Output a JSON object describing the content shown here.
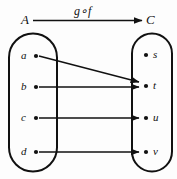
{
  "figure": {
    "type": "function-composition-mapping-diagram",
    "domain_set": {
      "name": "A",
      "elements": [
        "a",
        "b",
        "c",
        "d"
      ]
    },
    "codomain_set": {
      "name": "C",
      "elements": [
        "s",
        "t",
        "u",
        "v"
      ]
    },
    "mapping_label": "g∘f",
    "arrows": [
      {
        "from": "a",
        "to": "t"
      },
      {
        "from": "b",
        "to": "t"
      },
      {
        "from": "c",
        "to": "u"
      },
      {
        "from": "d",
        "to": "v"
      }
    ],
    "colors": {
      "ink": "#111111",
      "background": "#fdfdfd"
    }
  }
}
